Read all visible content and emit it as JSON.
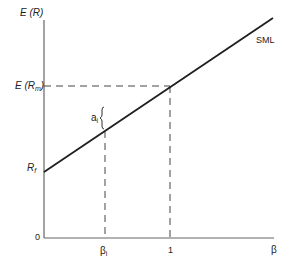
{
  "diagram": {
    "line_label": "SML",
    "y_axis": {
      "label_main": "E (",
      "label_var": "R",
      "label_close": ")",
      "ticks": {
        "market_main": "E (R",
        "market_sub": "m",
        "market_close": ")",
        "riskfree_main": "R",
        "riskfree_sub": "f",
        "origin": "0"
      }
    },
    "x_axis": {
      "label": "β",
      "ticks": {
        "beta_i_main": "β",
        "beta_i_sub": "i",
        "market_beta": "1"
      }
    },
    "annotation": {
      "alpha_main": "a",
      "alpha_sub": "i"
    },
    "colors": {
      "line": "#1e1e1e",
      "axis": "#555555",
      "dashed": "#444444"
    }
  }
}
